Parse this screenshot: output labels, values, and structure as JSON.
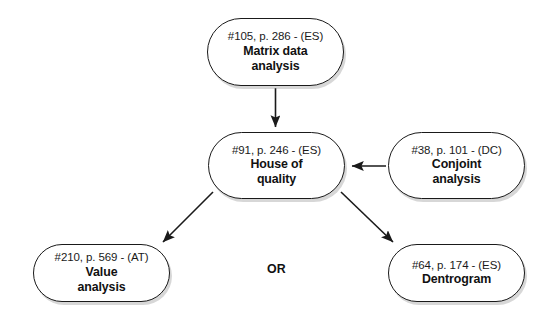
{
  "diagram": {
    "type": "flow-diagram",
    "background_color": "#ffffff",
    "line_color": "#1a1a1a",
    "text_color": "#111111",
    "nodes": [
      {
        "id": "matrix-data-analysis",
        "ref": "#105, p. 286 - (ES)",
        "title_line1": "Matrix data",
        "title_line2": "analysis",
        "code": "ES",
        "number": "105",
        "page": "286"
      },
      {
        "id": "house-of-quality",
        "ref": "#91, p. 246 - (ES)",
        "title_line1": "House of",
        "title_line2": "quality",
        "code": "ES",
        "number": "91",
        "page": "246"
      },
      {
        "id": "conjoint-analysis",
        "ref": "#38, p. 101 - (DC)",
        "title_line1": "Conjoint",
        "title_line2": "analysis",
        "code": "DC",
        "number": "38",
        "page": "101"
      },
      {
        "id": "value-analysis",
        "ref": "#210, p. 569 - (AT)",
        "title_line1": "Value",
        "title_line2": "analysis",
        "code": "AT",
        "number": "210",
        "page": "569"
      },
      {
        "id": "dentrogram",
        "ref": "#64, p. 174 - (ES)",
        "title_line1": "Dentrogram",
        "title_line2": "",
        "code": "ES",
        "number": "64",
        "page": "174"
      }
    ],
    "connector_label": "OR",
    "edges": [
      {
        "from": "matrix-data-analysis",
        "to": "house-of-quality",
        "direction": "down"
      },
      {
        "from": "conjoint-analysis",
        "to": "house-of-quality",
        "direction": "left"
      },
      {
        "from": "house-of-quality",
        "to": "value-analysis",
        "direction": "down-left"
      },
      {
        "from": "house-of-quality",
        "to": "dentrogram",
        "direction": "down-right"
      }
    ]
  }
}
